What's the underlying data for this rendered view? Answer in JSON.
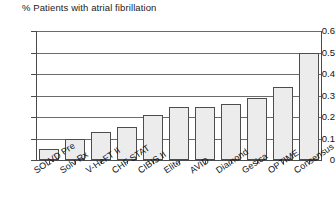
{
  "chart_data": {
    "type": "bar",
    "title": "% Patients with atrial fibrillation",
    "xlabel": "",
    "ylabel": "",
    "ylim": [
      0,
      0.6
    ],
    "yticks": [
      "0",
      "0.1",
      "0.2",
      "0.3",
      "0.4",
      "0.5",
      "0.6"
    ],
    "ytick_values": [
      0,
      0.1,
      0.2,
      0.3,
      0.4,
      0.5,
      0.6
    ],
    "grid": true,
    "legend": "none",
    "categories": [
      "SOLVD Pre",
      "Solv Rx",
      "V-HeFT II",
      "CHF STAT",
      "CIBIS II",
      "Elite",
      "AVID",
      "Diamond",
      "Gesica",
      "OPTIME",
      "Consensus"
    ],
    "values": [
      0.05,
      0.1,
      0.13,
      0.155,
      0.21,
      0.245,
      0.245,
      0.26,
      0.29,
      0.34,
      0.5
    ],
    "bar_fill_color": "#ececec",
    "bar_edge_color": "#4d4d4d",
    "grid_color": "#6b6b6b",
    "axis_color": "#4a4a4a",
    "text_color": "#111111"
  }
}
